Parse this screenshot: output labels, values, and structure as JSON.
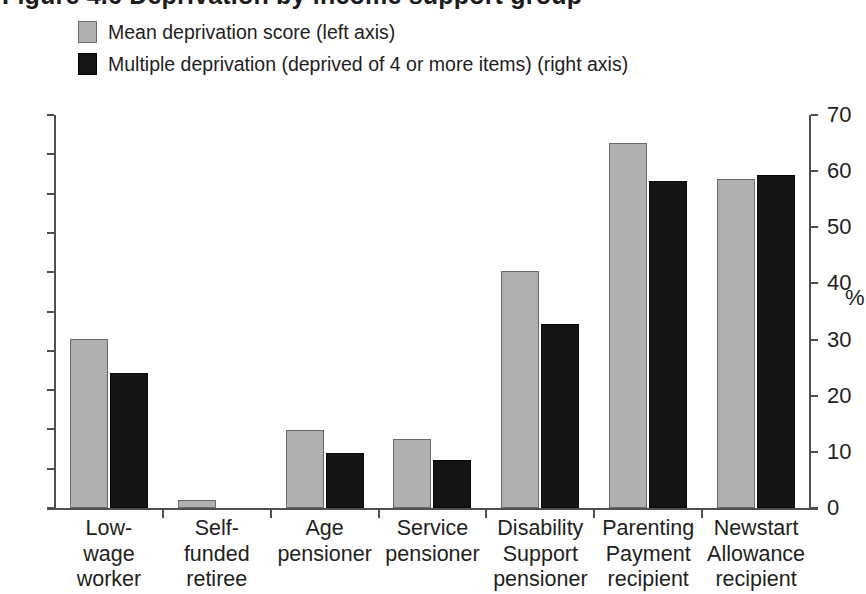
{
  "figure": {
    "title_cutoff": "Figure 4.6 Deprivation by income support group"
  },
  "legend": {
    "position": "top-left",
    "items": [
      {
        "label": "Mean deprivation score (left axis)",
        "color": "#b0b0b0",
        "swatch": "legend-swatch-series-a"
      },
      {
        "label": "Multiple deprivation (deprived of 4 or more items) (right axis)",
        "color": "#161616",
        "swatch": "legend-swatch-series-b"
      }
    ]
  },
  "axes": {
    "left": {
      "ticks": [
        "5.0",
        "4.5",
        "4.0",
        "3.5",
        "3.0",
        "2.5",
        "2.0",
        "1.5",
        "1.0",
        "0.5",
        "0"
      ],
      "min": 0,
      "max": 5.0,
      "step": 0.5
    },
    "right": {
      "ticks": [
        "70",
        "60",
        "50",
        "40",
        "30",
        "20",
        "10",
        "0"
      ],
      "min": 0,
      "max": 70,
      "step": 10,
      "unit": "%"
    }
  },
  "chart_data": {
    "type": "bar",
    "title": "Figure 4.6 Deprivation by income support group",
    "xlabel": "",
    "ylabel": "",
    "ylim": [
      0,
      5.0
    ],
    "y2lim": [
      0,
      70
    ],
    "grid": false,
    "legend_position": "top-left",
    "categories": [
      "Low-wage worker",
      "Self-funded retiree",
      "Age pensioner",
      "Service pensioner",
      "Disability Support pensioner",
      "Parenting Payment recipient",
      "Newstart Allowance recipient"
    ],
    "category_lines": [
      [
        "Low-",
        "wage",
        "worker"
      ],
      [
        "Self-",
        "funded",
        "retiree"
      ],
      [
        "Age",
        "pensioner"
      ],
      [
        "Service",
        "pensioner"
      ],
      [
        "Disability",
        "Support",
        "pensioner"
      ],
      [
        "Parenting",
        "Payment",
        "recipient"
      ],
      [
        "Newstart",
        "Allowance",
        "recipient"
      ]
    ],
    "series": [
      {
        "name": "Mean deprivation score (left axis)",
        "axis": "left",
        "color": "#b0b0b0",
        "values": [
          2.15,
          0.1,
          0.99,
          0.88,
          3.02,
          4.65,
          4.19
        ]
      },
      {
        "name": "Multiple deprivation (deprived of 4 or more items) (right axis)",
        "axis": "right",
        "color": "#161616",
        "values": [
          24.0,
          0.0,
          9.8,
          8.6,
          32.7,
          58.2,
          59.3
        ]
      }
    ]
  }
}
